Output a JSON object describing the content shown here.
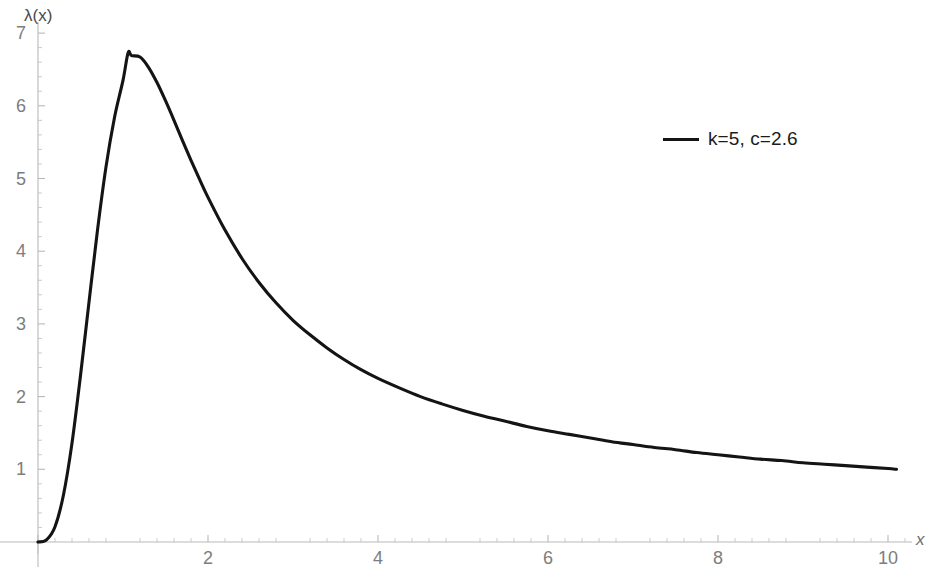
{
  "figure": {
    "background_color": "#ffffff",
    "width": 932,
    "height": 567
  },
  "axes": {
    "y_axis_label": "λ(x)",
    "x_axis_label": "x",
    "x_tick_labels": [
      "2",
      "4",
      "6",
      "8",
      "10"
    ],
    "y_tick_labels": [
      "1",
      "2",
      "3",
      "4",
      "5",
      "6",
      "7"
    ]
  },
  "legend": {
    "entries": [
      {
        "label": "k=5, c=2.6",
        "color": "#141414",
        "style": "solid-line"
      }
    ]
  },
  "chart_data": {
    "type": "line",
    "title": "",
    "subtitle": "",
    "xlabel": "x",
    "ylabel": "λ(x)",
    "xlim": [
      0,
      10.6
    ],
    "ylim": [
      0,
      7.1
    ],
    "xticks": [
      0,
      2,
      4,
      6,
      8,
      10
    ],
    "yticks": [
      0,
      1,
      2,
      3,
      4,
      5,
      6,
      7
    ],
    "xtick_labels": [
      "",
      "2",
      "4",
      "6",
      "8",
      "10"
    ],
    "ytick_labels": [
      "",
      "1",
      "2",
      "3",
      "4",
      "5",
      "6",
      "7"
    ],
    "x_minor_tick_step": 0.2,
    "y_minor_tick_step": 0.2,
    "grid": false,
    "legend_position": "upper-right",
    "annotations": [],
    "series": [
      {
        "name": "k=5, c=2.6",
        "color": "#141414",
        "line_width": 3.1,
        "peak": {
          "x": 1.06,
          "y": 6.73
        },
        "x": [
          0.0,
          0.1,
          0.2,
          0.3,
          0.4,
          0.5,
          0.6,
          0.7,
          0.8,
          0.9,
          1.0,
          1.06,
          1.1,
          1.2,
          1.3,
          1.4,
          1.5,
          1.6,
          1.7,
          1.8,
          1.9,
          2.0,
          2.2,
          2.4,
          2.6,
          2.8,
          3.0,
          3.2,
          3.4,
          3.6,
          3.8,
          4.0,
          4.25,
          4.5,
          4.75,
          5.0,
          5.25,
          5.5,
          5.75,
          6.0,
          6.25,
          6.5,
          6.75,
          7.0,
          7.25,
          7.5,
          7.75,
          8.0,
          8.25,
          8.5,
          8.75,
          9.0,
          9.25,
          9.5,
          9.75,
          10.0,
          10.1
        ],
        "y": [
          0.0,
          0.03,
          0.21,
          0.65,
          1.36,
          2.29,
          3.3,
          4.29,
          5.16,
          5.84,
          6.35,
          6.73,
          6.69,
          6.67,
          6.53,
          6.32,
          6.07,
          5.8,
          5.52,
          5.25,
          4.99,
          4.74,
          4.29,
          3.9,
          3.57,
          3.29,
          3.05,
          2.85,
          2.67,
          2.51,
          2.37,
          2.25,
          2.12,
          2.0,
          1.9,
          1.81,
          1.73,
          1.66,
          1.59,
          1.53,
          1.48,
          1.43,
          1.38,
          1.34,
          1.3,
          1.27,
          1.23,
          1.2,
          1.17,
          1.14,
          1.12,
          1.09,
          1.07,
          1.05,
          1.03,
          1.01,
          1.0
        ]
      }
    ]
  }
}
